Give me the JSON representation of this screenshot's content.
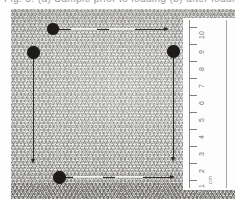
{
  "caption": {
    "text": "Fig. 3. (a) Sample prior to loading (b) after loading"
  },
  "image": {
    "subject": "woven-fabric-specimen",
    "background_color": "#cfcecb",
    "page_color": "#ffffff",
    "marker_color": "#1d1c1a",
    "annotation_color": "#2e2d2b"
  },
  "scale": {
    "unit": "cm",
    "ticks": [
      {
        "label": "10",
        "value": 10
      },
      {
        "label": "9",
        "value": 9
      },
      {
        "label": "8",
        "value": 8
      },
      {
        "label": "7",
        "value": 7
      },
      {
        "label": "6",
        "value": 6
      },
      {
        "label": "5",
        "value": 5
      },
      {
        "label": "4",
        "value": 4
      },
      {
        "label": "3",
        "value": 3
      },
      {
        "label": "2",
        "value": 2
      },
      {
        "label": "1",
        "value": 1
      }
    ],
    "min": 1,
    "max": 10,
    "orientation": "vertical",
    "panel_color": "#fdfdfd"
  },
  "markers": [
    {
      "id": "marker-top",
      "name": "gauge-marker-top"
    },
    {
      "id": "marker-left",
      "name": "gauge-marker-left"
    },
    {
      "id": "marker-right",
      "name": "gauge-marker-right"
    },
    {
      "id": "marker-bottom",
      "name": "gauge-marker-bottom"
    }
  ],
  "measurements": [
    {
      "id": "meas-top",
      "name": "horizontal-gauge-top",
      "direction": "horizontal"
    },
    {
      "id": "meas-bottom",
      "name": "horizontal-gauge-bottom",
      "direction": "horizontal"
    },
    {
      "id": "meas-left",
      "name": "vertical-gauge-left",
      "direction": "vertical"
    },
    {
      "id": "meas-right",
      "name": "vertical-gauge-right",
      "direction": "vertical"
    }
  ]
}
